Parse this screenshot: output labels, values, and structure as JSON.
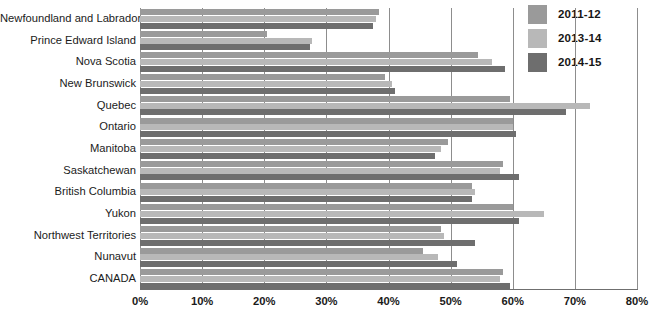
{
  "chart_data": {
    "type": "bar",
    "orientation": "horizontal",
    "title": "",
    "xlabel": "",
    "ylabel": "",
    "xlim": [
      0,
      80
    ],
    "xtick_labels": [
      "0%",
      "10%",
      "20%",
      "30%",
      "40%",
      "50%",
      "60%",
      "70%",
      "80%"
    ],
    "xtick_values": [
      0,
      10,
      20,
      30,
      40,
      50,
      60,
      70,
      80
    ],
    "grid": true,
    "legend_position": "top-right",
    "categories": [
      "Newfoundland and Labrador",
      "Prince Edward Island",
      "Nova Scotia",
      "New Brunswick",
      "Quebec",
      "Ontario",
      "Manitoba",
      "Saskatchewan",
      "British Columbia",
      "Yukon",
      "Northwest Territories",
      "Nunavut",
      "CANADA"
    ],
    "series": [
      {
        "name": "2011-12",
        "color": "#9a9a9a",
        "values": [
          38.5,
          20.5,
          54.4,
          39.5,
          59.5,
          60.0,
          49.5,
          58.5,
          53.5,
          60.0,
          48.5,
          45.5,
          58.5
        ]
      },
      {
        "name": "2013-14",
        "color": "#b8b8b8",
        "values": [
          38.0,
          27.7,
          56.7,
          40.5,
          72.5,
          60.0,
          48.5,
          58.0,
          54.0,
          65.0,
          49.0,
          48.0,
          58.0
        ]
      },
      {
        "name": "2014-15",
        "color": "#6e6e6e",
        "values": [
          37.5,
          27.3,
          58.8,
          41.0,
          68.5,
          60.5,
          47.5,
          61.0,
          53.5,
          61.0,
          54.0,
          51.0,
          59.5
        ]
      }
    ]
  },
  "legend": {
    "items": [
      {
        "label": "2011-12",
        "color": "#9a9a9a"
      },
      {
        "label": "2013-14",
        "color": "#b8b8b8"
      },
      {
        "label": "2014-15",
        "color": "#6e6e6e"
      }
    ]
  }
}
